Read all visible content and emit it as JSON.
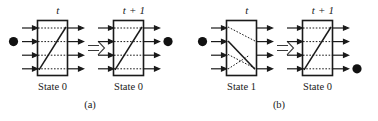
{
  "figure": {
    "type": "diagram",
    "background_color": "#ffffff",
    "line_color": "#1a1a1a",
    "ball_color": "#111111",
    "panels": [
      {
        "id": "a",
        "caption": "(a)",
        "units": [
          {
            "id": "a-t",
            "time_label": "t",
            "state_label": "State 0",
            "state_value": 0,
            "port_count": 4,
            "ball": {
              "present": true,
              "side": "left",
              "port_index": 2
            },
            "internal": {
              "solid_path": "diagonal-up",
              "dotted_paths": [
                "horizontal-1",
                "horizontal-2",
                "horizontal-3",
                "horizontal-4"
              ]
            }
          },
          {
            "id": "a-t1",
            "time_label": "t + 1",
            "state_label": "State 0",
            "state_value": 0,
            "port_count": 4,
            "ball": {
              "present": true,
              "side": "right",
              "port_index": 2
            },
            "internal": {
              "solid_path": "diagonal-up",
              "dotted_paths": [
                "horizontal-1",
                "horizontal-2",
                "horizontal-3",
                "horizontal-4"
              ]
            }
          }
        ],
        "transition_arrow": "⇒"
      },
      {
        "id": "b",
        "caption": "(b)",
        "units": [
          {
            "id": "b-t",
            "time_label": "t",
            "state_label": "State 1",
            "state_value": 1,
            "port_count": 4,
            "ball": {
              "present": true,
              "side": "left",
              "port_index": 2
            },
            "internal": {
              "solid_path": "diagonal-down",
              "dotted_paths": [
                "diagonal-down-1",
                "diagonal-down-3",
                "diagonal-up-4"
              ]
            }
          },
          {
            "id": "b-t1",
            "time_label": "t + 1",
            "state_label": "State 0",
            "state_value": 0,
            "port_count": 4,
            "ball": {
              "present": true,
              "side": "right",
              "port_index": 4
            },
            "internal": {
              "solid_path": "diagonal-up",
              "dotted_paths": [
                "horizontal-1",
                "horizontal-2",
                "horizontal-3",
                "horizontal-4"
              ]
            }
          }
        ],
        "transition_arrow": "⇒"
      }
    ]
  }
}
